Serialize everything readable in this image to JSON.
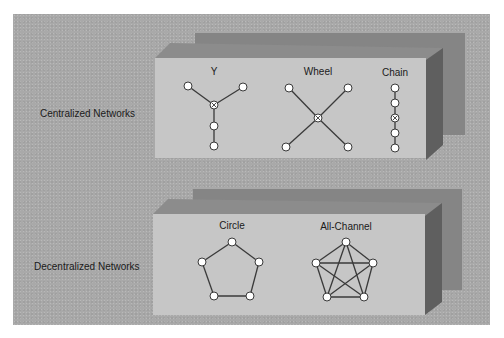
{
  "colors": {
    "background": "#ffffff",
    "panel": "#a9a9a9",
    "box_front": "#c6c6c6",
    "box_top": "#8c8c8c",
    "box_side": "#5f5f5f",
    "box_back": "#858585",
    "edge": "#3a3a3a",
    "node_fill": "#ffffff"
  },
  "groups": [
    {
      "label": "Centralized Networks",
      "networks": [
        {
          "name": "Y",
          "nodes": [
            [
              188,
              86
            ],
            [
              243,
              87
            ],
            [
              214,
              105
            ],
            [
              214,
              126
            ],
            [
              214,
              146
            ]
          ],
          "center_index": 2,
          "edges": [
            [
              0,
              2
            ],
            [
              1,
              2
            ],
            [
              2,
              3
            ],
            [
              3,
              4
            ]
          ]
        },
        {
          "name": "Wheel",
          "nodes": [
            [
              289,
              88
            ],
            [
              348,
              88
            ],
            [
              318,
              118
            ],
            [
              286,
              147
            ],
            [
              348,
              147
            ]
          ],
          "center_index": 2,
          "edges": [
            [
              0,
              2
            ],
            [
              1,
              2
            ],
            [
              3,
              2
            ],
            [
              4,
              2
            ]
          ]
        },
        {
          "name": "Chain",
          "nodes": [
            [
              395,
              88
            ],
            [
              395,
              103
            ],
            [
              395,
              118
            ],
            [
              395,
              133
            ],
            [
              395,
              148
            ]
          ],
          "center_index": 2,
          "edges": [
            [
              0,
              1
            ],
            [
              1,
              2
            ],
            [
              2,
              3
            ],
            [
              3,
              4
            ]
          ]
        }
      ]
    },
    {
      "label": "Decentralized Networks",
      "networks": [
        {
          "name": "Circle",
          "nodes": [
            [
              232,
              242
            ],
            [
              202,
              262
            ],
            [
              259,
              262
            ],
            [
              214,
              296
            ],
            [
              250,
              296
            ]
          ],
          "center_index": null,
          "edges": [
            [
              0,
              1
            ],
            [
              0,
              2
            ],
            [
              1,
              3
            ],
            [
              2,
              4
            ],
            [
              3,
              4
            ]
          ]
        },
        {
          "name": "All-Channel",
          "nodes": [
            [
              346,
              242
            ],
            [
              316,
              263
            ],
            [
              373,
              263
            ],
            [
              327,
              297
            ],
            [
              364,
              297
            ]
          ],
          "center_index": null,
          "edges": [
            [
              0,
              1
            ],
            [
              0,
              2
            ],
            [
              0,
              3
            ],
            [
              0,
              4
            ],
            [
              1,
              2
            ],
            [
              1,
              3
            ],
            [
              1,
              4
            ],
            [
              2,
              3
            ],
            [
              2,
              4
            ],
            [
              3,
              4
            ]
          ]
        }
      ]
    }
  ]
}
